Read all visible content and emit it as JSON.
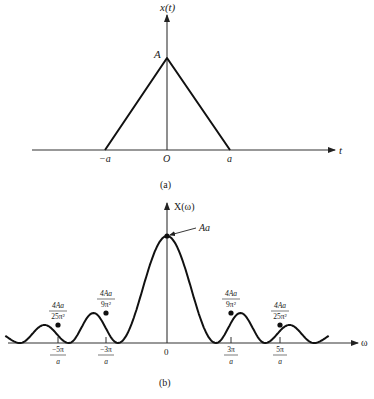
{
  "figure_a": {
    "caption": "(a)",
    "y_axis_label": "x(t)",
    "x_axis_label": "t",
    "peak_label": "A",
    "tick_labels": [
      "−a",
      "O",
      "a"
    ],
    "shape": "triangle",
    "points": [
      {
        "t": "-a",
        "value": 0
      },
      {
        "t": "0",
        "value": "A"
      },
      {
        "t": "a",
        "value": 0
      }
    ]
  },
  "figure_b": {
    "caption": "(b)",
    "y_axis_label": "X(ω)",
    "x_axis_label": "ω",
    "peak_label": "Aa",
    "origin_label": "0",
    "tick_labels": [
      {
        "num": "−5π",
        "den": "a"
      },
      {
        "num": "−3π",
        "den": "a"
      },
      {
        "num": "3π",
        "den": "a"
      },
      {
        "num": "5π",
        "den": "a"
      }
    ],
    "lobe_labels": [
      {
        "num": "4Aa",
        "den": "25π²"
      },
      {
        "num": "4Aa",
        "den": "9π²"
      },
      {
        "num": "4Aa",
        "den": "9π²"
      },
      {
        "num": "4Aa",
        "den": "25π²"
      }
    ]
  },
  "chart_data": [
    {
      "type": "line",
      "title": "(a)",
      "xlabel": "t",
      "ylabel": "x(t)",
      "x": [
        "-a",
        "0",
        "a"
      ],
      "values": [
        0,
        "A",
        0
      ],
      "description": "Triangular pulse of height A supported on [-a, a]"
    },
    {
      "type": "line",
      "title": "(b)",
      "xlabel": "ω",
      "ylabel": "X(ω)",
      "description": "Fourier transform of triangular pulse (sinc² shape), peak Aa at ω=0, zeros at ±2π/a, ±4π/a, ±6π/a",
      "x": [
        "-5π/a",
        "-3π/a",
        "0",
        "3π/a",
        "5π/a"
      ],
      "values": [
        "4Aa/25π²",
        "4Aa/9π²",
        "Aa",
        "4Aa/9π²",
        "4Aa/25π²"
      ],
      "zeros": [
        "±2π/a",
        "±4π/a",
        "±6π/a"
      ]
    }
  ]
}
